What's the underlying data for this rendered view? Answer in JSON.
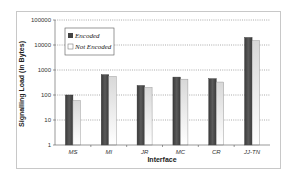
{
  "chart_data": {
    "type": "bar",
    "title": "",
    "xlabel": "Interface",
    "ylabel": "Signalling Load (in Bytes)",
    "yscale": "log",
    "ylim": [
      1,
      100000
    ],
    "yticks": [
      "1",
      "10",
      "100",
      "1000",
      "10000",
      "100000"
    ],
    "grid": true,
    "legend_position": "top-left inside",
    "categories": [
      "MS",
      "MI",
      "JR",
      "MC",
      "CR",
      "JJ-TN"
    ],
    "series": [
      {
        "name": "Encoded",
        "color": "#4a4a4a",
        "values": [
          100,
          650,
          240,
          520,
          450,
          20000
        ]
      },
      {
        "name": "Not Encoded",
        "color": "#e6e6e6",
        "values": [
          60,
          550,
          200,
          430,
          330,
          15000
        ]
      }
    ]
  }
}
